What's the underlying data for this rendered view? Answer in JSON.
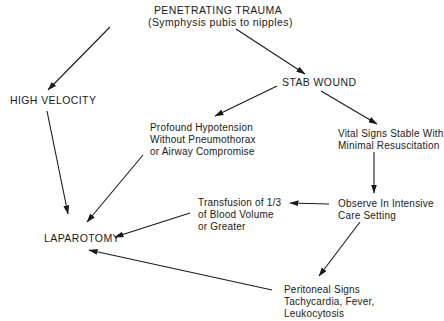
{
  "diagram": {
    "nodes": {
      "root": {
        "lines": [
          "PENETRATING TRAUMA",
          "(Symphysis pubis to nipples)"
        ]
      },
      "high_velocity": {
        "lines": [
          "HIGH VELOCITY"
        ]
      },
      "stab_wound": {
        "lines": [
          "STAB WOUND"
        ]
      },
      "profound_hypotension": {
        "lines": [
          "Profound Hypotension",
          "Without Pneumothorax",
          "or Airway Compromise"
        ]
      },
      "vital_signs_stable": {
        "lines": [
          "Vital Signs Stable With",
          "Minimal Resuscitation"
        ]
      },
      "transfusion": {
        "lines": [
          "Transfusion of 1/3",
          "of Blood Volume",
          "or Greater"
        ]
      },
      "observe_icu": {
        "lines": [
          "Observe In Intensive",
          "Care Setting"
        ]
      },
      "laparotomy": {
        "lines": [
          "LAPAROTOMY"
        ]
      },
      "peritoneal_signs": {
        "lines": [
          "Peritoneal Signs",
          "Tachycardia, Fever,",
          "Leukocytosis"
        ]
      }
    },
    "edges": [
      {
        "from": "root",
        "to": "high_velocity"
      },
      {
        "from": "root",
        "to": "stab_wound"
      },
      {
        "from": "high_velocity",
        "to": "laparotomy"
      },
      {
        "from": "stab_wound",
        "to": "profound_hypotension"
      },
      {
        "from": "stab_wound",
        "to": "vital_signs_stable"
      },
      {
        "from": "profound_hypotension",
        "to": "laparotomy"
      },
      {
        "from": "vital_signs_stable",
        "to": "observe_icu"
      },
      {
        "from": "observe_icu",
        "to": "transfusion"
      },
      {
        "from": "observe_icu",
        "to": "peritoneal_signs"
      },
      {
        "from": "transfusion",
        "to": "laparotomy"
      },
      {
        "from": "peritoneal_signs",
        "to": "laparotomy"
      }
    ],
    "colors": {
      "ink": "#1a1a1a",
      "background": "#ffffff"
    }
  }
}
